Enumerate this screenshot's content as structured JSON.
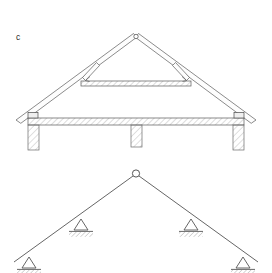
{
  "figure": {
    "label": "c",
    "label_position": {
      "x": 16,
      "y": 40
    },
    "background_color": "#ffffff",
    "line_color": "#3c3c3c",
    "hatch_color": "#9a9a9a",
    "panels": [
      {
        "name": "roof-truss-section",
        "description": "Section drawing of a timber gable roof truss on masonry walls"
      },
      {
        "name": "structural-idealization",
        "description": "Three-hinged gable frame idealization with four pinned supports"
      }
    ]
  },
  "truss_drawing": {
    "apex": {
      "x": 136,
      "y": 36
    },
    "apex_joint_radius": 2.2,
    "left_eave": {
      "x": 16,
      "y": 120
    },
    "right_eave": {
      "x": 256,
      "y": 120
    },
    "rafter_thickness": 4.5,
    "collar_beam": {
      "name": "collar-beam",
      "left_x": 81,
      "right_x": 191,
      "y": 81,
      "height": 5,
      "hatched": true
    },
    "braces": [
      {
        "name": "left-brace",
        "x1": 95,
        "y1": 64,
        "x2": 84,
        "y2": 79
      },
      {
        "name": "right-brace",
        "x1": 177,
        "y1": 64,
        "x2": 188,
        "y2": 79
      }
    ],
    "tie_beam": {
      "name": "ceiling-tie-beam",
      "left_x": 28,
      "right_x": 244,
      "y": 118,
      "height": 7,
      "hatched": true
    },
    "wall_plates": [
      {
        "name": "left-wall-plate",
        "x": 28,
        "y": 113,
        "w": 10,
        "h": 5
      },
      {
        "name": "right-wall-plate",
        "x": 234,
        "y": 113,
        "w": 10,
        "h": 5
      }
    ],
    "columns": [
      {
        "name": "left-wall-column",
        "x": 28,
        "y": 125,
        "w": 11,
        "h": 25
      },
      {
        "name": "centre-wall-column",
        "x": 131,
        "y": 125,
        "w": 11,
        "h": 22
      },
      {
        "name": "right-wall-column",
        "x": 233,
        "y": 125,
        "w": 11,
        "h": 25
      }
    ]
  },
  "frame_diagram": {
    "apex": {
      "x": 136,
      "y": 174
    },
    "apex_hinge": {
      "name": "apex-hinge",
      "shape": "circle",
      "radius": 3.6,
      "fill": "#ffffff"
    },
    "left_end": {
      "x": 14,
      "y": 262
    },
    "right_end": {
      "x": 258,
      "y": 262
    },
    "member_color": "#555555",
    "supports": [
      {
        "name": "support-outer-left",
        "x": 29,
        "y": 257,
        "size": 11,
        "base_width": 24,
        "hatch_direction": "right"
      },
      {
        "name": "support-inner-left",
        "x": 81,
        "y": 219,
        "size": 11,
        "base_width": 24,
        "hatch_direction": "right"
      },
      {
        "name": "support-inner-right",
        "x": 191,
        "y": 219,
        "size": 11,
        "base_width": 24,
        "hatch_direction": "right"
      },
      {
        "name": "support-outer-right",
        "x": 243,
        "y": 257,
        "size": 11,
        "base_width": 24,
        "hatch_direction": "right"
      }
    ]
  }
}
